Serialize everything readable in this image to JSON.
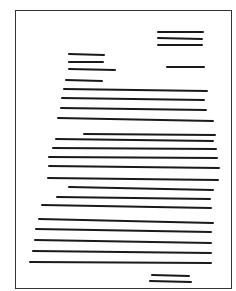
{
  "diagram": {
    "title": "",
    "frame": {
      "x": 15,
      "y": 10,
      "width": 217,
      "height": 279,
      "stroke": "#333333"
    },
    "line_color": "#1a1a1a",
    "line_width": 2,
    "blocks": [
      {
        "name": "heading-block",
        "lines": [
          {
            "x1": 158,
            "y1": 32,
            "x2": 203,
            "y2": 32
          },
          {
            "x1": 158,
            "y1": 38,
            "x2": 202,
            "y2": 39
          },
          {
            "x1": 158,
            "y1": 45,
            "x2": 202,
            "y2": 45
          }
        ]
      },
      {
        "name": "date-line",
        "lines": [
          {
            "x1": 167,
            "y1": 67,
            "x2": 204,
            "y2": 67
          }
        ]
      },
      {
        "name": "inside-address-block",
        "lines": [
          {
            "x1": 69,
            "y1": 54,
            "x2": 104,
            "y2": 55
          },
          {
            "x1": 69,
            "y1": 62,
            "x2": 103,
            "y2": 62
          },
          {
            "x1": 69,
            "y1": 69,
            "x2": 115,
            "y2": 70
          }
        ]
      },
      {
        "name": "salutation-line",
        "lines": [
          {
            "x1": 66,
            "y1": 80,
            "x2": 102,
            "y2": 81
          }
        ]
      },
      {
        "name": "body-paragraph-1",
        "lines": [
          {
            "x1": 64,
            "y1": 89,
            "x2": 207,
            "y2": 91
          },
          {
            "x1": 62,
            "y1": 98,
            "x2": 204,
            "y2": 100
          },
          {
            "x1": 61,
            "y1": 108,
            "x2": 206,
            "y2": 110
          },
          {
            "x1": 58,
            "y1": 118,
            "x2": 213,
            "y2": 121
          }
        ]
      },
      {
        "name": "body-paragraph-2",
        "lines": [
          {
            "x1": 84,
            "y1": 134,
            "x2": 215,
            "y2": 135
          },
          {
            "x1": 56,
            "y1": 139,
            "x2": 213,
            "y2": 141
          },
          {
            "x1": 53,
            "y1": 148,
            "x2": 216,
            "y2": 149
          },
          {
            "x1": 49,
            "y1": 157,
            "x2": 217,
            "y2": 158
          },
          {
            "x1": 49,
            "y1": 166,
            "x2": 219,
            "y2": 168
          },
          {
            "x1": 48,
            "y1": 178,
            "x2": 218,
            "y2": 180
          }
        ]
      },
      {
        "name": "body-paragraph-3",
        "lines": [
          {
            "x1": 69,
            "y1": 187,
            "x2": 213,
            "y2": 190
          },
          {
            "x1": 57,
            "y1": 197,
            "x2": 210,
            "y2": 199
          },
          {
            "x1": 42,
            "y1": 205,
            "x2": 211,
            "y2": 208
          },
          {
            "x1": 39,
            "y1": 219,
            "x2": 213,
            "y2": 223
          },
          {
            "x1": 36,
            "y1": 229,
            "x2": 211,
            "y2": 232
          },
          {
            "x1": 35,
            "y1": 240,
            "x2": 211,
            "y2": 243
          },
          {
            "x1": 33,
            "y1": 251,
            "x2": 211,
            "y2": 253
          },
          {
            "x1": 30,
            "y1": 262,
            "x2": 211,
            "y2": 263
          }
        ]
      },
      {
        "name": "signature-block",
        "lines": [
          {
            "x1": 152,
            "y1": 275,
            "x2": 189,
            "y2": 276
          },
          {
            "x1": 150,
            "y1": 281,
            "x2": 191,
            "y2": 282
          }
        ]
      }
    ]
  }
}
